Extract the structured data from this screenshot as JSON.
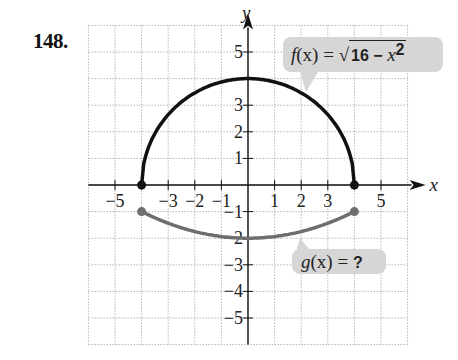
{
  "problem": {
    "number": "148."
  },
  "axes": {
    "x_label": "x",
    "y_label": "y",
    "x_ticks": [
      "−5",
      "−3",
      "−2",
      "−1",
      "1",
      "2",
      "3",
      "5"
    ],
    "y_ticks": [
      "5",
      "3",
      "2",
      "1",
      "−1",
      "−2",
      "−3",
      "−4",
      "−5"
    ]
  },
  "labels": {
    "f": {
      "lhs_name": "f",
      "lhs_arg": "(x)",
      "eq": " = ",
      "radicand_num": "16 − ",
      "radicand_var": "x",
      "radicand_exp": "2"
    },
    "g": {
      "lhs_name": "g",
      "lhs_arg": "(x)",
      "eq": " = ",
      "rhs": "?"
    }
  },
  "colors": {
    "f_curve": "#111111",
    "g_curve": "#6e6e6e",
    "bubble": "#d6d6d6",
    "grid": "#b5b5b5"
  },
  "chart_data": {
    "type": "line",
    "title": "148.",
    "xlabel": "x",
    "ylabel": "y",
    "xlim": [
      -6,
      6
    ],
    "ylim": [
      -6,
      6
    ],
    "grid": true,
    "x_tick_labels": [
      -5,
      -3,
      -2,
      -1,
      1,
      2,
      3,
      5
    ],
    "y_tick_labels": [
      5,
      3,
      2,
      1,
      -1,
      -2,
      -3,
      -4,
      -5
    ],
    "series": [
      {
        "name": "f(x) = √(16 − x²)",
        "color": "#111111",
        "domain": [
          -4,
          4
        ],
        "endpoints": [
          [
            -4,
            0
          ],
          [
            4,
            0
          ]
        ],
        "x": [
          -4,
          -3,
          -2,
          -1,
          0,
          1,
          2,
          3,
          4
        ],
        "values": [
          0,
          2.65,
          3.46,
          3.87,
          4,
          3.87,
          3.46,
          2.65,
          0
        ]
      },
      {
        "name": "g(x) = ?",
        "color": "#6e6e6e",
        "domain": [
          -4,
          4
        ],
        "endpoints": [
          [
            -4,
            -1
          ],
          [
            4,
            -1
          ]
        ],
        "x": [
          -4,
          -3,
          -2,
          -1,
          0,
          1,
          2,
          3,
          4
        ],
        "values": [
          -1,
          -1.34,
          -1.75,
          -1.94,
          -2,
          -1.94,
          -1.75,
          -1.34,
          -1
        ]
      }
    ],
    "annotations": [
      "f(x) = √(16 − x²)",
      "g(x) = ?"
    ]
  }
}
